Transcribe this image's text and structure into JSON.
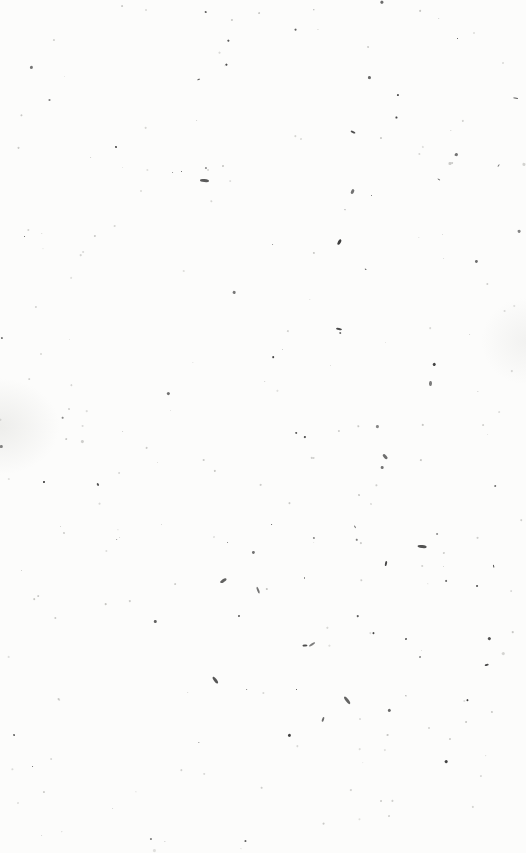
{
  "surface": {
    "description": "Blank off-white textured paper with scattered dark specks",
    "background_color": "#fcfcfb",
    "speck_color_dark": "#3a3a3a",
    "speck_color_light": "#b5b5b2",
    "speck_count": 260,
    "seed": 7
  }
}
